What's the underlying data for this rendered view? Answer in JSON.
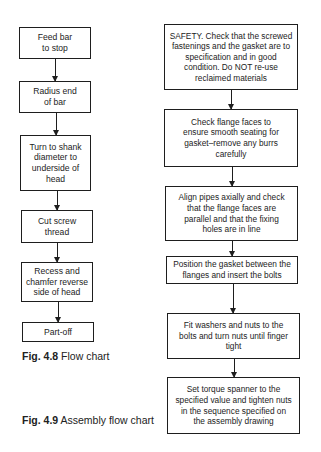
{
  "figures": [
    {
      "id": "fig-4-8",
      "caption_number": "Fig. 4.8",
      "caption_text": " Flow chart",
      "steps": [
        "Feed bar to stop",
        "Radius end of bar",
        "Turn to shank diameter to underside of head",
        "Cut screw thread",
        "Recess and chamfer reverse side of head",
        "Part-off"
      ]
    },
    {
      "id": "fig-4-9",
      "caption_number": "Fig. 4.9",
      "caption_text": " Assembly flow chart",
      "steps": [
        "SAFETY. Check that the screwed fastenings and the gasket are to specification and in good condition. Do NOT re-use reclaimed materials",
        "Check flange faces to ensure smooth seating for gasket–remove any burrs carefully",
        "Align pipes axially and check that the flange faces are parallel and that the fixing holes are in line",
        "Position the gasket between the flanges and insert the bolts",
        "Fit washers and nuts to the bolts and turn nuts until finger tight",
        "Set torque spanner to the specified value and tighten nuts in the sequence specified on the assembly drawing"
      ]
    }
  ]
}
